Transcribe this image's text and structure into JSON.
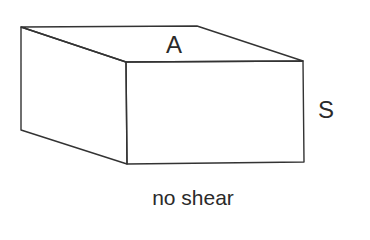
{
  "diagram": {
    "type": "3d-box",
    "labels": {
      "area": "A",
      "side": "S"
    },
    "caption": "no shear",
    "colors": {
      "line": "#333333",
      "background": "#ffffff"
    }
  }
}
